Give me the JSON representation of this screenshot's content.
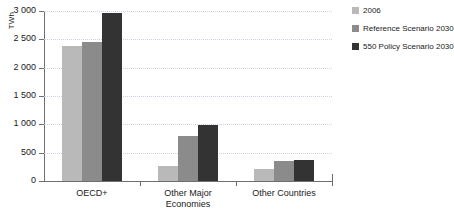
{
  "chart_data": {
    "type": "bar",
    "title": "",
    "xlabel": "",
    "ylabel": "TWh",
    "ylim": [
      0,
      3000
    ],
    "ytick_values": [
      3000,
      2500,
      2000,
      1500,
      1000,
      500,
      0
    ],
    "ytick_labels": [
      "3 000",
      "2 500",
      "2 000",
      "1 500",
      "1 000",
      "500",
      "0"
    ],
    "grid": true,
    "legend_position": "right",
    "categories": [
      "OECD+",
      "Other Major\nEconomies",
      "Other Countries"
    ],
    "series": [
      {
        "name": "2006",
        "color": "#b9b9b9",
        "values": [
          2390,
          270,
          210
        ]
      },
      {
        "name": "Reference Scenario 2030",
        "color": "#8b8b8b",
        "values": [
          2450,
          790,
          350
        ]
      },
      {
        "name": "550 Policy Scenario 2030",
        "color": "#333333",
        "values": [
          2960,
          990,
          370
        ]
      }
    ]
  },
  "legend": {
    "items": [
      {
        "label": "2006",
        "color": "#b9b9b9"
      },
      {
        "label": "Reference Scenario 2030",
        "color": "#8b8b8b"
      },
      {
        "label": "550 Policy Scenario 2030",
        "color": "#333333"
      }
    ]
  },
  "axis": {
    "y_unit": "TWh"
  }
}
